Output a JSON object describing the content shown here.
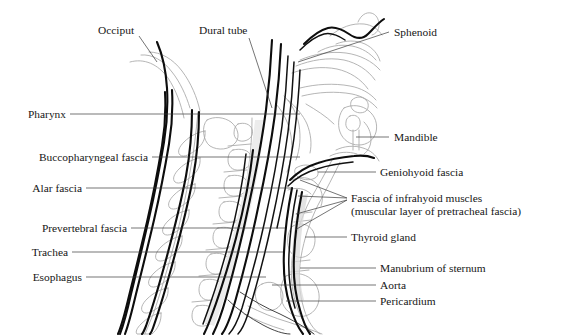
{
  "figure": {
    "background_color": "#ffffff",
    "text_color": "#161616",
    "fascia_line_color": "#0d0d0d",
    "outline_light_color": "#a8a8a8",
    "leader_line_color": "#3a3a3a",
    "width": 566,
    "height": 335
  },
  "labels_top": [
    {
      "id": "occiput",
      "text": "Occiput",
      "x": 98,
      "y": 34
    },
    {
      "id": "dural-tube",
      "text": "Dural tube",
      "x": 199,
      "y": 34
    }
  ],
  "labels_left": [
    {
      "id": "pharynx",
      "text": "Pharynx",
      "x": 24,
      "y": 118
    },
    {
      "id": "buccopharyngeal-fascia",
      "text": "Buccopharyngeal fascia",
      "x": 24,
      "y": 161
    },
    {
      "id": "alar-fascia",
      "text": "Alar fascia",
      "x": 24,
      "y": 192
    },
    {
      "id": "prevertebral-fascia",
      "text": "Prevertebral fascia",
      "x": 24,
      "y": 232
    },
    {
      "id": "trachea",
      "text": "Trachea",
      "x": 24,
      "y": 256
    },
    {
      "id": "esophagus",
      "text": "Esophagus",
      "x": 24,
      "y": 281
    }
  ],
  "labels_right": [
    {
      "id": "sphenoid",
      "text": "Sphenoid",
      "x": 394,
      "y": 36
    },
    {
      "id": "mandible",
      "text": "Mandible",
      "x": 394,
      "y": 141
    },
    {
      "id": "geniohyoid-fascia",
      "text": "Geniohyoid fascia",
      "x": 380,
      "y": 176
    },
    {
      "id": "fascia-infrahyoid-muscles",
      "text": "Fascia of infrahyoid muscles",
      "x": 351,
      "y": 202
    },
    {
      "id": "fascia-infrahyoid-muscles-sub",
      "text": "(muscular layer of pretracheal fascia)",
      "x": 351,
      "y": 215
    },
    {
      "id": "thyroid-gland",
      "text": "Thyroid gland",
      "x": 351,
      "y": 241
    },
    {
      "id": "manubrium-of-sternum",
      "text": "Manubrium of sternum",
      "x": 380,
      "y": 272
    },
    {
      "id": "aorta",
      "text": "Aorta",
      "x": 380,
      "y": 289
    },
    {
      "id": "pericardium",
      "text": "Pericardium",
      "x": 380,
      "y": 305
    }
  ],
  "anatomy_parts": [
    "occipital-bone",
    "cervical-vertebrae",
    "dural-tube",
    "pharynx",
    "buccopharyngeal-fascia",
    "alar-fascia",
    "prevertebral-fascia",
    "trachea",
    "esophagus",
    "sphenoid-bone",
    "mandible",
    "geniohyoid-fascia",
    "infrahyoid-fascia",
    "thyroid-gland",
    "manubrium",
    "aorta",
    "pericardium",
    "hard-palate",
    "tongue",
    "nasal-cavity",
    "hyoid-bone",
    "larynx"
  ]
}
